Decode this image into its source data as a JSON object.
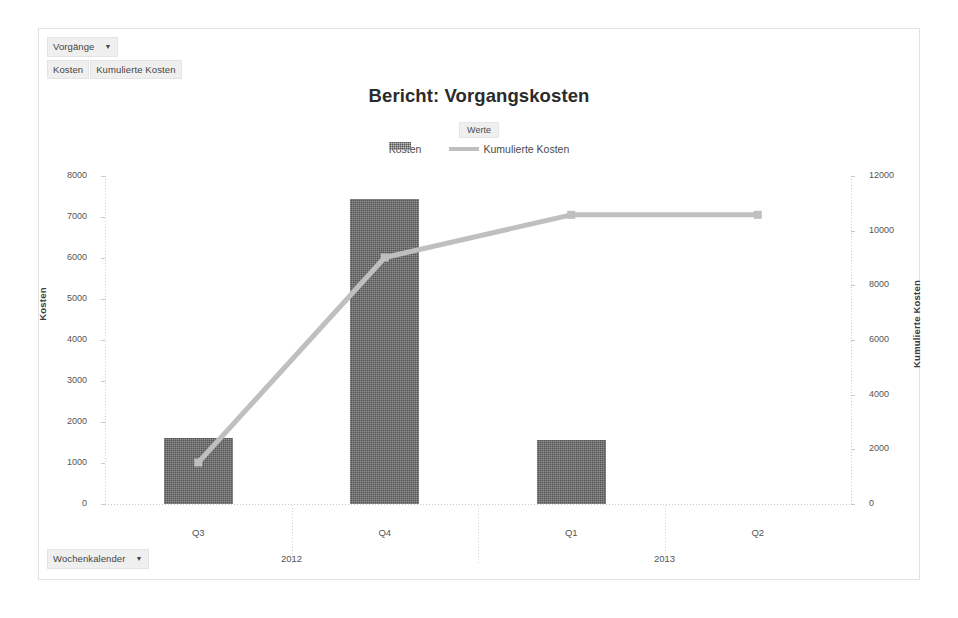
{
  "report": {
    "title": "Bericht: Vorgangskosten",
    "filter_field": "Vorgänge",
    "filter_caret": "▼",
    "category_field": "Wochenkalender",
    "category_caret": "▼",
    "series_fields": [
      "Kosten",
      "Kumulierte Kosten"
    ],
    "legend_title": "Werte"
  },
  "colors": {
    "bar": "#555555",
    "line": "#bfbfbf",
    "axis": "#c9c9c9",
    "text": "#4a4a4a",
    "frame": "#e2e2e2",
    "field_button": "#efefef"
  },
  "chart_data": {
    "type": "bar",
    "title": "Bericht: Vorgangskosten",
    "xlabel": "",
    "ylabel": "Kosten",
    "y2label": "Kumulierte Kosten",
    "categories": [
      "Q3",
      "Q4",
      "Q1",
      "Q2"
    ],
    "groups": [
      {
        "label": "2012",
        "categories": [
          "Q3",
          "Q4"
        ]
      },
      {
        "label": "2013",
        "categories": [
          "Q1",
          "Q2"
        ]
      }
    ],
    "ylim": [
      0,
      8000
    ],
    "yticks": [
      0,
      1000,
      2000,
      3000,
      4000,
      5000,
      6000,
      7000,
      8000
    ],
    "y2lim": [
      0,
      12000
    ],
    "y2ticks": [
      0,
      2000,
      4000,
      6000,
      8000,
      10000,
      12000
    ],
    "grid": false,
    "legend_position": "top",
    "series": [
      {
        "name": "Kosten",
        "type": "bar",
        "axis": "left",
        "values": [
          1600,
          7450,
          1550,
          null
        ]
      },
      {
        "name": "Kumulierte Kosten",
        "type": "line",
        "axis": "right",
        "values": [
          1520,
          9020,
          10580,
          10580
        ]
      }
    ]
  }
}
